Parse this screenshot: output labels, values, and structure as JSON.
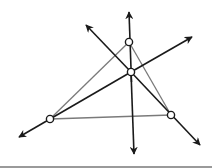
{
  "diagram": {
    "colors": {
      "line": "#1a1a1a",
      "triangle_edge": "#7a7a7a",
      "point_fill": "#ffffff",
      "point_stroke": "#1a1a1a",
      "bottom_bar": "#9a9a9a"
    },
    "points": {
      "A": [
        129,
        42
      ],
      "B": [
        50,
        119
      ],
      "C": [
        171,
        115
      ],
      "O": [
        131,
        72
      ]
    },
    "lines": [
      {
        "name": "vertical-line",
        "from": [
          129,
          10
        ],
        "to": [
          134,
          155
        ]
      },
      {
        "name": "descending-line",
        "from": [
          85,
          24
        ],
        "to": [
          201,
          146
        ]
      },
      {
        "name": "ascending-line",
        "from": [
          18,
          138
        ],
        "to": [
          193,
          36
        ]
      }
    ]
  }
}
